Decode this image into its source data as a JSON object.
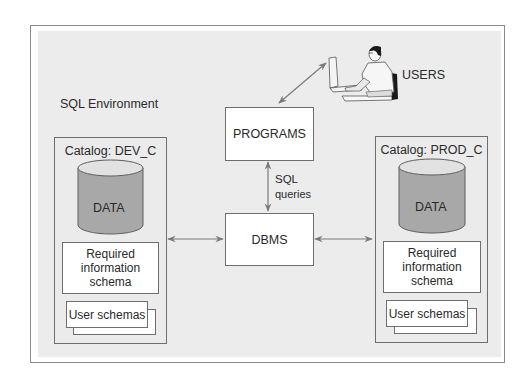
{
  "diagram": {
    "environment_label": "SQL Environment",
    "users": {
      "label": "USERS",
      "icon": "person-at-computer-icon"
    },
    "programs": {
      "label": "PROGRAMS"
    },
    "dbms": {
      "label": "DBMS"
    },
    "sql_link": {
      "line1": "SQL",
      "line2": "queries"
    },
    "catalogs": [
      {
        "title": "Catalog: DEV_C",
        "data_label": "DATA",
        "info_schema": {
          "line1": "Required",
          "line2": "information",
          "line3": "schema"
        },
        "user_schemas": "User schemas"
      },
      {
        "title": "Catalog: PROD_C",
        "data_label": "DATA",
        "info_schema": {
          "line1": "Required",
          "line2": "information",
          "line3": "schema"
        },
        "user_schemas": "User schemas"
      }
    ],
    "connections": [
      {
        "from": "USERS",
        "to": "PROGRAMS",
        "type": "bidirectional"
      },
      {
        "from": "PROGRAMS",
        "to": "DBMS",
        "type": "bidirectional",
        "label": "SQL queries"
      },
      {
        "from": "Catalog: DEV_C",
        "to": "DBMS",
        "type": "bidirectional"
      },
      {
        "from": "DBMS",
        "to": "Catalog: PROD_C",
        "type": "bidirectional"
      }
    ],
    "colors": {
      "panel_bg": "#ececec",
      "box_border": "#6e6e6e",
      "cylinder_body": "#a8a8a8",
      "cylinder_top": "#e2e2e2",
      "arrow": "#7a7a7a"
    }
  }
}
